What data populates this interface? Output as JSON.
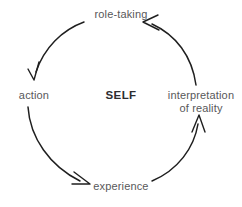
{
  "diagram": {
    "background_color": "#ffffff",
    "text_color": "#58585a",
    "center_text_color": "#2d2d2f",
    "stroke_color": "#1f1f1f",
    "center": {
      "label": "SELF"
    },
    "nodes": [
      {
        "id": "role-taking",
        "label": "role-taking",
        "position": "top"
      },
      {
        "id": "action",
        "label": "action",
        "position": "left"
      },
      {
        "id": "interpretation-of-reality",
        "label": "interpretation",
        "label_line2": "of reality",
        "position": "right"
      },
      {
        "id": "experience",
        "label": "experience",
        "position": "bottom"
      }
    ],
    "edges": [
      {
        "id": "role-taking-to-action",
        "from": "role-taking",
        "to": "action",
        "direction": "clockwise-left-down"
      },
      {
        "id": "action-to-experience",
        "from": "action",
        "to": "experience",
        "direction": "clockwise-down-right"
      },
      {
        "id": "experience-to-interpretation",
        "from": "experience",
        "to": "interpretation-of-reality",
        "direction": "clockwise-right-up"
      },
      {
        "id": "interpretation-to-role-taking",
        "from": "interpretation-of-reality",
        "to": "role-taking",
        "direction": "clockwise-up-left"
      }
    ]
  }
}
